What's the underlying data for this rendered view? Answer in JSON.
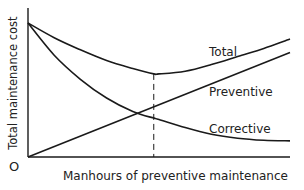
{
  "chart_data": {
    "type": "line",
    "title": "",
    "xlabel": "Manhours of preventive maintenance",
    "ylabel": "Total maintenance cost",
    "origin_label": "O",
    "xlim": [
      0,
      10
    ],
    "ylim": [
      0,
      10
    ],
    "grid": false,
    "legend": "inline labels near curve ends",
    "x": [
      0,
      1,
      2,
      3,
      4,
      4.8,
      5,
      6,
      7,
      8,
      9,
      10
    ],
    "series": [
      {
        "name": "Total",
        "values": [
          10.0,
          8.9,
          8.0,
          7.2,
          6.6,
          6.2,
          6.2,
          6.4,
          6.9,
          7.5,
          8.1,
          8.8
        ]
      },
      {
        "name": "Preventive",
        "values": [
          0.0,
          0.78,
          1.56,
          2.34,
          3.12,
          3.74,
          3.9,
          4.68,
          5.46,
          6.24,
          7.02,
          7.8
        ]
      },
      {
        "name": "Corrective",
        "values": [
          10.0,
          7.6,
          5.8,
          4.4,
          3.4,
          2.9,
          2.8,
          2.2,
          1.7,
          1.4,
          1.25,
          1.2
        ]
      }
    ],
    "annotations": [
      {
        "type": "vertical-dashed-line",
        "x": 4.8,
        "label": "Optimum (minimum total cost)"
      }
    ]
  },
  "labels": {
    "total": "Total",
    "preventive": "Preventive",
    "corrective": "Corrective",
    "origin": "O",
    "xlabel": "Manhours of preventive maintenance",
    "ylabel": "Total maintenance cost"
  }
}
